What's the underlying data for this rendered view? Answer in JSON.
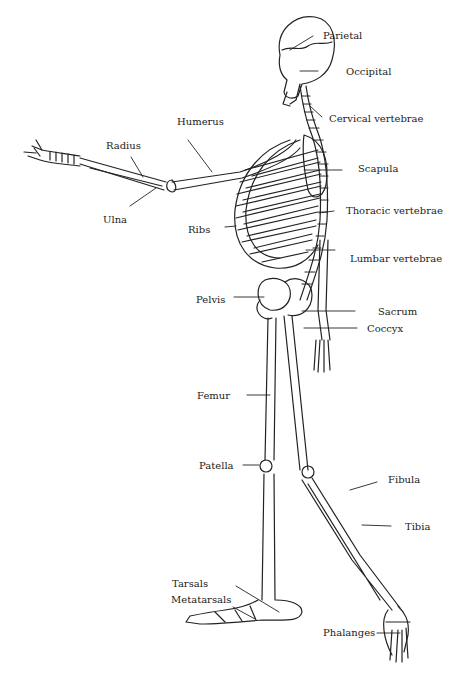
{
  "diagram": {
    "labels": [
      {
        "id": "parietal",
        "text": "Parietal",
        "x": 323,
        "y": 30
      },
      {
        "id": "occipital",
        "text": "Occipital",
        "x": 346,
        "y": 66
      },
      {
        "id": "cervical",
        "text": "Cervical vertebrae",
        "x": 329,
        "y": 113
      },
      {
        "id": "humerus",
        "text": "Humerus",
        "x": 177,
        "y": 116
      },
      {
        "id": "radius",
        "text": "Radius",
        "x": 106,
        "y": 140
      },
      {
        "id": "scapula",
        "text": "Scapula",
        "x": 358,
        "y": 163
      },
      {
        "id": "ulna",
        "text": "Ulna",
        "x": 103,
        "y": 214
      },
      {
        "id": "thoracic",
        "text": "Thoracic vertebrae",
        "x": 346,
        "y": 205
      },
      {
        "id": "ribs",
        "text": "Ribs",
        "x": 188,
        "y": 224
      },
      {
        "id": "lumbar",
        "text": "Lumbar vertebrae",
        "x": 350,
        "y": 253
      },
      {
        "id": "pelvis",
        "text": "Pelvis",
        "x": 196,
        "y": 294
      },
      {
        "id": "sacrum",
        "text": "Sacrum",
        "x": 378,
        "y": 308
      },
      {
        "id": "coccyx",
        "text": "Coccyx",
        "x": 367,
        "y": 325
      },
      {
        "id": "femur",
        "text": "Femur",
        "x": 197,
        "y": 392
      },
      {
        "id": "patella",
        "text": "Patella",
        "x": 199,
        "y": 462
      },
      {
        "id": "fibula",
        "text": "Fibula",
        "x": 388,
        "y": 475
      },
      {
        "id": "tibia",
        "text": "Tibia",
        "x": 405,
        "y": 523
      },
      {
        "id": "tarsals",
        "text": "Tarsals",
        "x": 172,
        "y": 580
      },
      {
        "id": "metatarsals",
        "text": "Metatarsals",
        "x": 171,
        "y": 595
      },
      {
        "id": "phalanges",
        "text": "Phalanges",
        "x": 323,
        "y": 629
      }
    ]
  }
}
